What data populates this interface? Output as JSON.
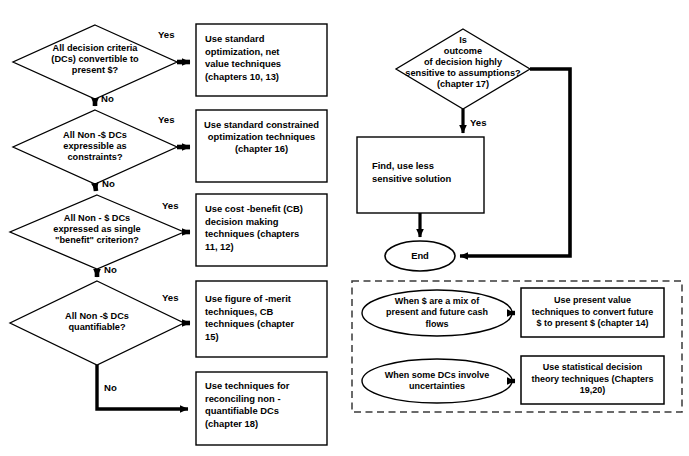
{
  "diagram": {
    "colors": {
      "stroke": "#000000",
      "fill": "#ffffff",
      "dashed_border": "#3a3a3a",
      "text": "#000000"
    },
    "left_column": {
      "decisions": [
        {
          "id": "d1",
          "text": "All decision criteria\n(DCs) convertible to\npresent $?",
          "yes_label": "Yes",
          "no_label": "No"
        },
        {
          "id": "d2",
          "text": "All Non -$ DCs\nexpressible as\nconstraints?",
          "yes_label": "Yes",
          "no_label": "No"
        },
        {
          "id": "d3",
          "text": "All Non - $ DCs\nexpressed as single\n\"benefit\" criterion?",
          "yes_label": "Yes",
          "no_label": "No"
        },
        {
          "id": "d4",
          "text": "All Non -$ DCs\nquantifiable?",
          "yes_label": "Yes",
          "no_label": "No"
        }
      ],
      "outcomes": [
        {
          "id": "o1",
          "text": "Use standard\noptimization, net\nvalue techniques\n(chapters 10, 13)",
          "align": "left"
        },
        {
          "id": "o2",
          "text": "Use standard constrained\noptimization techniques\n(chapter 16)",
          "align": "center"
        },
        {
          "id": "o3",
          "text": "Use cost -benefit (CB)\ndecision making\ntechniques (chapters\n11, 12)",
          "align": "left"
        },
        {
          "id": "o4",
          "text": "Use figure of -merit\ntechniques, CB\ntechniques  (chapter\n15)",
          "align": "left"
        },
        {
          "id": "o5",
          "text": "Use techniques for\nreconciling non -\nquantifiable  DCs\n(chapter 18)",
          "align": "left"
        }
      ]
    },
    "right_column": {
      "decision": {
        "id": "d5",
        "text": "Is\noutcome\nof decision highly\nsensitive to assumptions?\n(chapter 17)",
        "yes_label": "Yes"
      },
      "process": {
        "id": "p1",
        "text": "Find, use less\nsensitive solution"
      },
      "terminator": {
        "id": "end",
        "text": "End"
      }
    },
    "notes_panel": {
      "border_style": "dashed",
      "rows": [
        {
          "condition": "When $ are a mix of\npresent and future cash\nflows",
          "action": "Use present value\ntechniques to convert future\n$ to present $ (chapter 14)"
        },
        {
          "condition": "When some  DCs  involve\nuncertainties",
          "action": "Use statistical decision\ntheory techniques (Chapters\n19,20)"
        }
      ]
    }
  }
}
